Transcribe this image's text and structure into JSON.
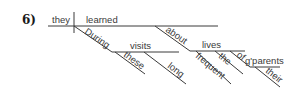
{
  "diagram": {
    "number_label": "6)",
    "type": "sentence diagram (Reed-Kellogg)",
    "words": {
      "subject": "they",
      "verb": "learned",
      "prep1": "During",
      "obj1": "visits",
      "mod_these": "these",
      "mod_long": "long",
      "prep2": "about",
      "obj2": "lives",
      "mod_frequent": "frequent",
      "mod_the": "the",
      "prep3": "of",
      "obj3": "g'parents",
      "mod_their": "their"
    },
    "colors": {
      "line": "#3a3a3a",
      "text": "#3a3a3a",
      "background": "#ffffff"
    }
  }
}
